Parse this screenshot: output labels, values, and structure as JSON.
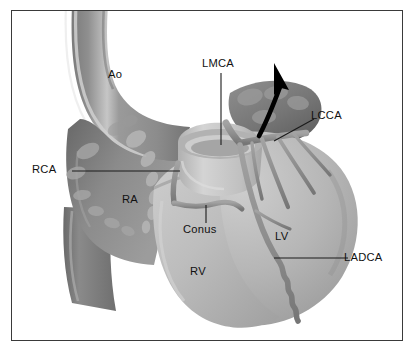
{
  "figure": {
    "style": "grayscale medical illustration",
    "frame_color": "#3a3a3a",
    "background_color": "#ffffff"
  },
  "palette": {
    "aorta_fill": "#8d8d8d",
    "aorta_shadow": "#6f6f6f",
    "aorta_highlight": "#c9c9c9",
    "right_atrium": "#8a8a8a",
    "right_atrium_dark": "#6e6e6e",
    "ventricle_fill": "#b9b9b9",
    "ventricle_light": "#cfcfcf",
    "ventricle_shadow": "#9d9d9d",
    "artery_fill": "#949494",
    "artery_shadow": "#7b7b7b",
    "pulmonary_trunk": "#c6c6c6",
    "vena_cava": "#7a7a7a",
    "leader_line": "#1a1a1a",
    "arrow": "#000000",
    "label_text": "#111111"
  },
  "labels": [
    {
      "id": "ao",
      "text": "Ao",
      "x": 107,
      "y": 66,
      "leader": "none"
    },
    {
      "id": "lmca",
      "text": "LMCA",
      "x": 200,
      "y": 57,
      "leader": "vertical"
    },
    {
      "id": "lcca",
      "text": "LCCA",
      "x": 307,
      "y": 109,
      "leader": "diagonal"
    },
    {
      "id": "rca",
      "text": "RCA",
      "x": 31,
      "y": 166,
      "leader": "horizontal"
    },
    {
      "id": "ra",
      "text": "RA",
      "x": 120,
      "y": 193,
      "leader": "none"
    },
    {
      "id": "conus",
      "text": "Conus",
      "x": 185,
      "y": 223,
      "leader": "vertical-short"
    },
    {
      "id": "lv",
      "text": "LV",
      "x": 272,
      "y": 230,
      "leader": "none"
    },
    {
      "id": "rv",
      "text": "RV",
      "x": 188,
      "y": 265,
      "leader": "none"
    },
    {
      "id": "ladca",
      "text": "LADCA",
      "x": 343,
      "y": 253,
      "leader": "horizontal"
    }
  ],
  "structures": [
    {
      "name": "ascending-aorta",
      "label": "Ao"
    },
    {
      "name": "right-atrium",
      "label": "RA"
    },
    {
      "name": "right-ventricle",
      "label": "RV"
    },
    {
      "name": "left-ventricle",
      "label": "LV"
    },
    {
      "name": "pulmonary-trunk-stump",
      "label": ""
    },
    {
      "name": "inferior-vena-cava",
      "label": ""
    },
    {
      "name": "left-main-coronary-artery",
      "label": "LMCA"
    },
    {
      "name": "left-circumflex-coronary-artery",
      "label": "LCCA"
    },
    {
      "name": "left-anterior-descending-coronary-artery",
      "label": "LADCA"
    },
    {
      "name": "right-coronary-artery",
      "label": "RCA"
    },
    {
      "name": "conus-branch",
      "label": "Conus"
    }
  ],
  "annotations": [
    {
      "name": "circumflex-direction-arrow",
      "shape": "curved-arrow",
      "direction": "up-right"
    }
  ]
}
